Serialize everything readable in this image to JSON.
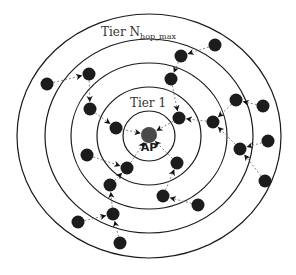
{
  "diagram": {
    "title_outer_tier": "Tier N",
    "title_outer_sub": "hop_max",
    "title_inner_tier": "Tier 1",
    "ap_label": "AP",
    "center": [
      149,
      136
    ],
    "rings": [
      {
        "rx": 26,
        "ry": 25
      },
      {
        "rx": 52,
        "ry": 49
      },
      {
        "rx": 78,
        "ry": 73
      },
      {
        "rx": 104,
        "ry": 97
      },
      {
        "rx": 132,
        "ry": 122
      }
    ],
    "nodes": [
      {
        "id": "n1",
        "x": 47,
        "y": 84
      },
      {
        "id": "n2",
        "x": 89,
        "y": 74
      },
      {
        "id": "n3",
        "x": 90,
        "y": 109
      },
      {
        "id": "n4",
        "x": 116,
        "y": 128
      },
      {
        "id": "n5",
        "x": 215,
        "y": 45
      },
      {
        "id": "n6",
        "x": 181,
        "y": 56
      },
      {
        "id": "n7",
        "x": 171,
        "y": 79
      },
      {
        "id": "n8",
        "x": 179,
        "y": 118
      },
      {
        "id": "n9",
        "x": 236,
        "y": 100
      },
      {
        "id": "n10",
        "x": 263,
        "y": 106
      },
      {
        "id": "n11",
        "x": 213,
        "y": 122
      },
      {
        "id": "n12",
        "x": 268,
        "y": 141
      },
      {
        "id": "n13",
        "x": 240,
        "y": 149
      },
      {
        "id": "n14",
        "x": 265,
        "y": 181
      },
      {
        "id": "n15",
        "x": 87,
        "y": 155
      },
      {
        "id": "n16",
        "x": 127,
        "y": 168
      },
      {
        "id": "n17",
        "x": 110,
        "y": 185
      },
      {
        "id": "n18",
        "x": 113,
        "y": 214
      },
      {
        "id": "n19",
        "x": 78,
        "y": 222
      },
      {
        "id": "n20",
        "x": 120,
        "y": 243
      },
      {
        "id": "n21",
        "x": 177,
        "y": 163
      },
      {
        "id": "n22",
        "x": 163,
        "y": 196
      },
      {
        "id": "n23",
        "x": 198,
        "y": 205
      }
    ],
    "links": [
      [
        "n1",
        "n2"
      ],
      [
        "n2",
        "n3"
      ],
      [
        "n3",
        "n4"
      ],
      [
        "n4",
        "ap"
      ],
      [
        "n5",
        "n6"
      ],
      [
        "n6",
        "n7"
      ],
      [
        "n7",
        "n8"
      ],
      [
        "n8",
        "ap"
      ],
      [
        "n10",
        "n9"
      ],
      [
        "n9",
        "n11"
      ],
      [
        "n11",
        "n8"
      ],
      [
        "n12",
        "n13"
      ],
      [
        "n14",
        "n13"
      ],
      [
        "n13",
        "n11"
      ],
      [
        "n15",
        "n16"
      ],
      [
        "n16",
        "ap"
      ],
      [
        "n17",
        "n16"
      ],
      [
        "n18",
        "n17"
      ],
      [
        "n19",
        "n18"
      ],
      [
        "n20",
        "n18"
      ],
      [
        "n21",
        "ap"
      ],
      [
        "n22",
        "n21"
      ],
      [
        "n23",
        "n22"
      ]
    ]
  }
}
